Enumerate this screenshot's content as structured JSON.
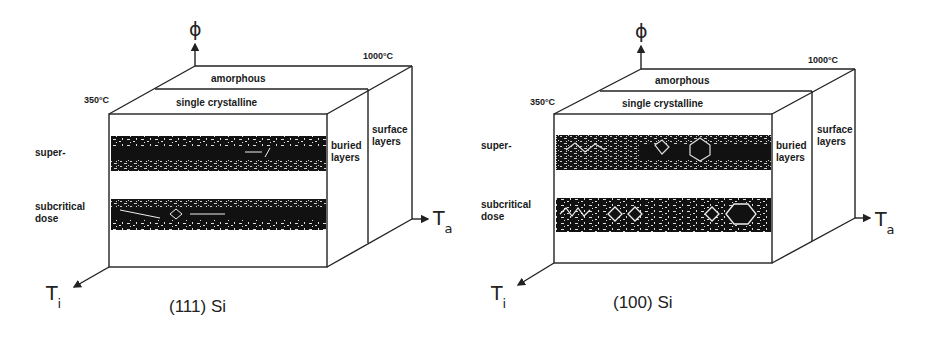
{
  "figure": {
    "panels": [
      {
        "caption": "(111) Si",
        "axes": {
          "vertical": "ϕ",
          "horizontal": "T",
          "horizontal_sub": "a",
          "depth": "T",
          "depth_sub": "i"
        },
        "temps": {
          "low": "350°C",
          "high": "1000°C"
        },
        "top_labels": {
          "back": "amorphous",
          "front": "single crystalline"
        },
        "side_labels": {
          "buried": [
            "buried",
            "layers"
          ],
          "surface": [
            "surface",
            "layers"
          ]
        },
        "left_labels": {
          "super": "super-",
          "subcritical": [
            "subcritical",
            "dose"
          ]
        }
      },
      {
        "caption": "(100) Si",
        "axes": {
          "vertical": "ϕ",
          "horizontal": "T",
          "horizontal_sub": "a",
          "depth": "T",
          "depth_sub": "i"
        },
        "temps": {
          "low": "350°C",
          "high": "1000°C"
        },
        "top_labels": {
          "back": "amorphous",
          "front": "single crystalline"
        },
        "side_labels": {
          "buried": [
            "buried",
            "layers"
          ],
          "surface": [
            "surface",
            "layers"
          ]
        },
        "left_labels": {
          "super": "super-",
          "subcritical": [
            "subcritical",
            "dose"
          ]
        }
      }
    ]
  }
}
